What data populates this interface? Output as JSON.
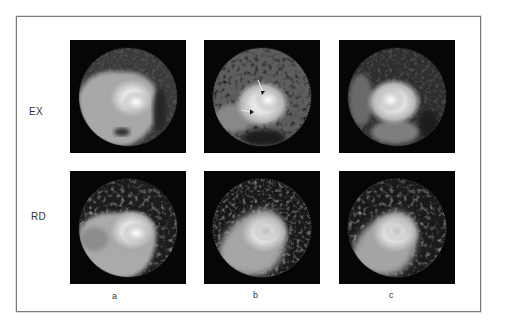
{
  "figure": {
    "row_labels": [
      "EX",
      "RD"
    ],
    "column_labels": [
      "a",
      "b",
      "c"
    ],
    "panels": [
      {
        "row": "EX",
        "col": "a",
        "arrows": 0
      },
      {
        "row": "EX",
        "col": "b",
        "arrows": 2
      },
      {
        "row": "EX",
        "col": "c",
        "arrows": 0
      },
      {
        "row": "RD",
        "col": "a",
        "arrows": 0
      },
      {
        "row": "RD",
        "col": "b",
        "arrows": 0
      },
      {
        "row": "RD",
        "col": "c",
        "arrows": 0
      }
    ],
    "colors": {
      "panel_background": "#060606",
      "frame_border": "#7a7a7a",
      "ring_gray": "#5a5a5a",
      "hot_white": "#f4f4f4"
    }
  }
}
